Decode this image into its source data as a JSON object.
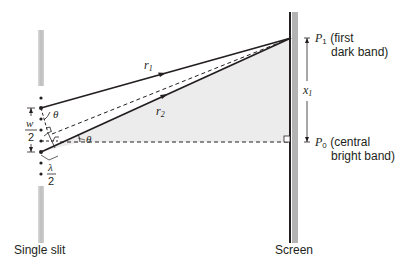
{
  "diagram": {
    "type": "single-slit diffraction geometry",
    "labels": {
      "slit": "Single slit",
      "screen": "Screen",
      "r1": "r",
      "r1_sub": "1",
      "r2": "r",
      "r2_sub": "2",
      "theta": "θ",
      "w_num": "w",
      "w_den": "2",
      "lambda_num": "λ",
      "lambda_den": "2",
      "x1": "x",
      "x1_sub": "1",
      "p1": "P",
      "p1_sub": "1",
      "p1_desc_line1": "(first",
      "p1_desc_line2": "dark band)",
      "p0": "P",
      "p0_sub": "0",
      "p0_desc_line1": "(central",
      "p0_desc_line2": "bright band)"
    },
    "colors": {
      "line": "#231f20",
      "shade": "#ececec",
      "slit_gray": "#b8b8b8",
      "screen_gray": "#b0b0b0"
    }
  }
}
